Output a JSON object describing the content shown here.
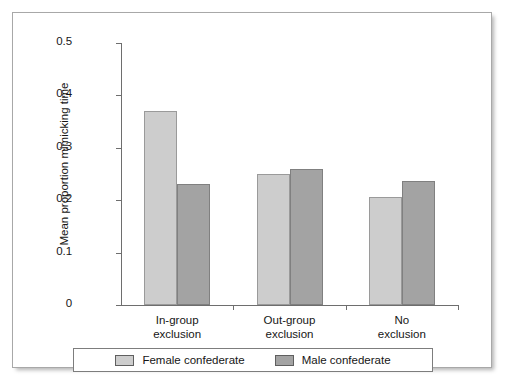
{
  "chart_data": {
    "type": "bar",
    "title": "",
    "xlabel": "",
    "ylabel": "Mean proportion mimicking time",
    "ylim": [
      0,
      0.5
    ],
    "ytick_labels": [
      "0.5",
      "0.4",
      "0.3",
      "0.2",
      "0.1",
      "0"
    ],
    "ytick_values": [
      0.5,
      0.4,
      0.3,
      0.2,
      0.1,
      0
    ],
    "grid": false,
    "legend_position": "bottom",
    "categories": [
      {
        "line1": "In-group",
        "line2": "exclusion"
      },
      {
        "line1": "Out-group",
        "line2": "exclusion"
      },
      {
        "line1": "No",
        "line2": "exclusion"
      }
    ],
    "category_labels": [
      "In-group exclusion",
      "Out-group exclusion",
      "No exclusion"
    ],
    "series": [
      {
        "name": "Female confederate",
        "color": "#cdcdcd",
        "values": [
          0.37,
          0.25,
          0.207
        ]
      },
      {
        "name": "Male confederate",
        "color": "#a3a3a3",
        "values": [
          0.23,
          0.26,
          0.236
        ]
      }
    ]
  },
  "legend": {
    "items": [
      {
        "label": "Female confederate",
        "swatch": "female"
      },
      {
        "label": "Male confederate",
        "swatch": "male"
      }
    ]
  },
  "colors": {
    "female_bar": "#cdcdcd",
    "male_bar": "#a3a3a3",
    "axis": "#6e6e6e",
    "text": "#161616",
    "frame_border": "#a8a8a8"
  }
}
